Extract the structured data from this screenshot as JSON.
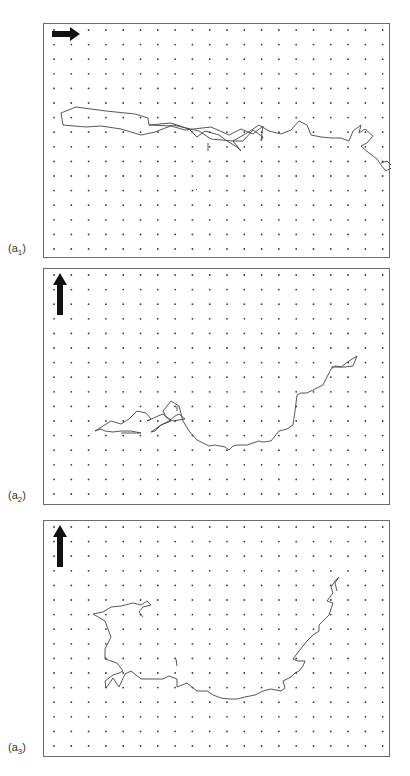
{
  "figure": {
    "grid": {
      "cols": 20,
      "rows": 16,
      "x0": 10,
      "dx": 17.3,
      "y0": 6,
      "dy": 14.6,
      "dot_color": "#3a3a3a"
    },
    "line_color": "#444444",
    "arrow_color": "#111111",
    "panels": [
      {
        "id": "a1",
        "label_main": "(a",
        "label_sub": "1",
        "label_close": ")",
        "top": 23,
        "height": 235,
        "arrow": "right",
        "path": [
          [
            62,
            124
          ],
          [
            60,
            112
          ],
          [
            75,
            106
          ],
          [
            105,
            110
          ],
          [
            134,
            113
          ],
          [
            147,
            117
          ],
          [
            148,
            124
          ],
          [
            170,
            125
          ],
          [
            184,
            129
          ],
          [
            210,
            126
          ],
          [
            228,
            134
          ],
          [
            240,
            128
          ],
          [
            252,
            133
          ],
          [
            262,
            125
          ],
          [
            260,
            140
          ],
          [
            262,
            136
          ],
          [
            252,
            129
          ],
          [
            242,
            140
          ],
          [
            232,
            140
          ],
          [
            210,
            138
          ],
          [
            198,
            130
          ],
          [
            172,
            124
          ],
          [
            154,
            131
          ],
          [
            140,
            134
          ],
          [
            120,
            128
          ],
          [
            100,
            125
          ],
          [
            85,
            126
          ],
          [
            62,
            124
          ]
        ],
        "path2": [
          [
            148,
            124
          ],
          [
            170,
            122
          ],
          [
            188,
            128
          ],
          [
            196,
            136
          ],
          [
            204,
            130
          ],
          [
            218,
            134
          ],
          [
            226,
            140
          ],
          [
            236,
            146
          ],
          [
            240,
            150
          ],
          [
            232,
            140
          ],
          [
            246,
            132
          ],
          [
            258,
            124
          ],
          [
            268,
            130
          ],
          [
            280,
            133
          ],
          [
            290,
            129
          ],
          [
            298,
            120
          ],
          [
            306,
            124
          ],
          [
            310,
            134
          ],
          [
            320,
            136
          ],
          [
            330,
            137
          ],
          [
            340,
            137
          ],
          [
            348,
            140
          ],
          [
            352,
            130
          ],
          [
            360,
            124
          ],
          [
            358,
            132
          ],
          [
            364,
            128
          ],
          [
            372,
            135
          ],
          [
            366,
            142
          ],
          [
            360,
            145
          ],
          [
            368,
            152
          ],
          [
            376,
            158
          ],
          [
            380,
            164
          ],
          [
            385,
            170
          ],
          [
            392,
            166
          ],
          [
            386,
            160
          ],
          [
            380,
            162
          ]
        ],
        "stray": [
          [
            207,
            142
          ],
          [
            207,
            150
          ],
          [
            195,
            188
          ],
          [
            196,
            189
          ]
        ]
      },
      {
        "id": "a2",
        "label_main": "(a",
        "label_sub": "2",
        "label_close": ")",
        "top": 268,
        "height": 237,
        "arrow": "up",
        "path": [
          [
            94,
            430
          ],
          [
            102,
            425
          ],
          [
            110,
            420
          ],
          [
            120,
            423
          ],
          [
            128,
            418
          ],
          [
            136,
            410
          ],
          [
            145,
            412
          ],
          [
            150,
            418
          ],
          [
            146,
            420
          ],
          [
            157,
            415
          ],
          [
            162,
            413
          ],
          [
            170,
            420
          ],
          [
            160,
            424
          ],
          [
            154,
            430
          ],
          [
            150,
            431
          ],
          [
            160,
            424
          ],
          [
            168,
            420
          ],
          [
            174,
            415
          ],
          [
            178,
            413
          ],
          [
            184,
            418
          ],
          [
            172,
            420
          ],
          [
            165,
            416
          ],
          [
            162,
            410
          ],
          [
            170,
            400
          ],
          [
            178,
            405
          ],
          [
            182,
            420
          ],
          [
            188,
            430
          ],
          [
            196,
            439
          ],
          [
            208,
            445
          ],
          [
            214,
            444
          ],
          [
            224,
            446
          ],
          [
            228,
            449
          ],
          [
            232,
            445
          ],
          [
            236,
            444
          ],
          [
            246,
            444
          ],
          [
            258,
            440
          ],
          [
            262,
            441
          ],
          [
            270,
            440
          ],
          [
            278,
            430
          ],
          [
            286,
            428
          ],
          [
            292,
            424
          ],
          [
            294,
            410
          ],
          [
            296,
            394
          ],
          [
            300,
            392
          ],
          [
            306,
            392
          ],
          [
            316,
            387
          ],
          [
            322,
            384
          ],
          [
            326,
            376
          ],
          [
            330,
            368
          ],
          [
            334,
            365
          ],
          [
            340,
            366
          ],
          [
            348,
            360
          ],
          [
            356,
            355
          ],
          [
            352,
            365
          ],
          [
            344,
            366
          ],
          [
            336,
            366
          ],
          [
            330,
            366
          ]
        ],
        "path2": [
          [
            94,
            430
          ],
          [
            100,
            428
          ],
          [
            104,
            430
          ],
          [
            112,
            431
          ],
          [
            120,
            430
          ],
          [
            126,
            430
          ],
          [
            130,
            430
          ],
          [
            140,
            432
          ],
          [
            130,
            432
          ],
          [
            120,
            432
          ]
        ],
        "stray": [
          [
            176,
            405
          ],
          [
            176,
            410
          ]
        ]
      },
      {
        "id": "a3",
        "label_main": "(a",
        "label_sub": "3",
        "label_close": ")",
        "top": 520,
        "height": 237,
        "arrow": "up",
        "path": [
          [
            105,
            687
          ],
          [
            110,
            680
          ],
          [
            112,
            677
          ],
          [
            118,
            686
          ],
          [
            124,
            673
          ],
          [
            130,
            670
          ],
          [
            140,
            678
          ],
          [
            152,
            678
          ],
          [
            162,
            678
          ],
          [
            168,
            675
          ],
          [
            176,
            678
          ],
          [
            176,
            686
          ],
          [
            186,
            682
          ],
          [
            196,
            690
          ],
          [
            206,
            690
          ],
          [
            212,
            694
          ],
          [
            220,
            697
          ],
          [
            228,
            698
          ],
          [
            236,
            698
          ],
          [
            244,
            696
          ],
          [
            254,
            694
          ],
          [
            262,
            690
          ],
          [
            270,
            688
          ],
          [
            280,
            690
          ],
          [
            284,
            687
          ],
          [
            282,
            680
          ],
          [
            290,
            676
          ],
          [
            294,
            672
          ],
          [
            298,
            670
          ],
          [
            302,
            665
          ],
          [
            304,
            660
          ],
          [
            297,
            660
          ],
          [
            292,
            658
          ],
          [
            298,
            650
          ],
          [
            306,
            640
          ],
          [
            312,
            634
          ],
          [
            318,
            630
          ],
          [
            318,
            624
          ],
          [
            322,
            620
          ],
          [
            328,
            614
          ],
          [
            330,
            608
          ],
          [
            332,
            602
          ],
          [
            326,
            600
          ],
          [
            332,
            592
          ],
          [
            330,
            586
          ],
          [
            334,
            580
          ],
          [
            338,
            576
          ],
          [
            334,
            582
          ],
          [
            336,
            590
          ]
        ],
        "path2": [
          [
            105,
            687
          ],
          [
            104,
            680
          ],
          [
            112,
            674
          ],
          [
            118,
            672
          ],
          [
            122,
            670
          ],
          [
            116,
            662
          ],
          [
            104,
            658
          ],
          [
            104,
            648
          ],
          [
            110,
            636
          ],
          [
            104,
            620
          ],
          [
            92,
            613
          ],
          [
            102,
            611
          ],
          [
            110,
            606
          ],
          [
            120,
            605
          ],
          [
            132,
            602
          ],
          [
            140,
            604
          ],
          [
            146,
            600
          ],
          [
            150,
            604
          ],
          [
            142,
            606
          ],
          [
            138,
            611
          ],
          [
            142,
            616
          ]
        ],
        "stray": [
          [
            175,
            658
          ],
          [
            176,
            665
          ]
        ]
      }
    ]
  }
}
